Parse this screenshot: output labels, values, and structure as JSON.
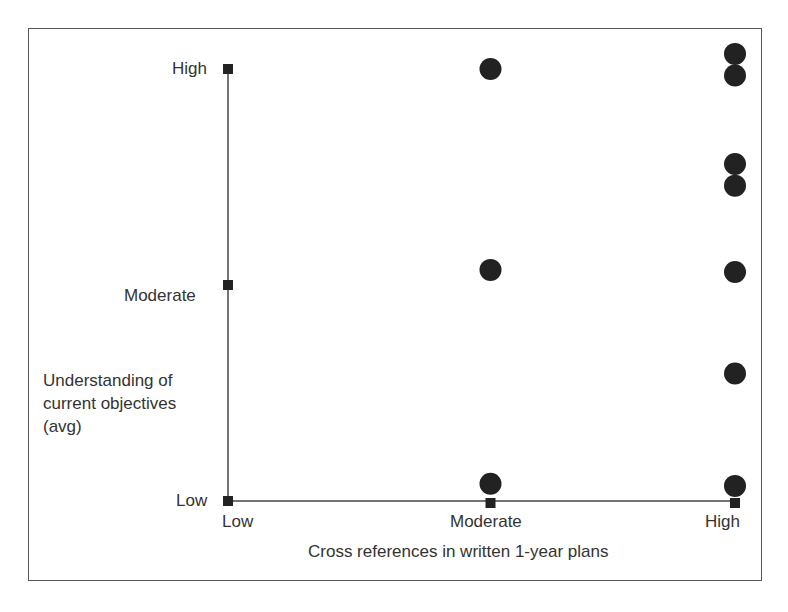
{
  "chart_data": {
    "type": "scatter",
    "title": "",
    "xlabel": "Cross references in written 1-year plans",
    "ylabel": "Understanding of current objectives (avg)",
    "ylabel_lines": [
      "Understanding of",
      "current objectives",
      "(avg)"
    ],
    "x_ticks": [
      "Low",
      "Moderate",
      "High"
    ],
    "y_ticks": [
      "Low",
      "Moderate",
      "High"
    ],
    "xlim": [
      0,
      2
    ],
    "ylim": [
      0,
      2
    ],
    "grid": false,
    "legend": null,
    "points": [
      {
        "x": 1,
        "y": 2.0
      },
      {
        "x": 1,
        "y": 1.07
      },
      {
        "x": 1,
        "y": 0.08
      },
      {
        "x": 2,
        "y": 2.07
      },
      {
        "x": 2,
        "y": 1.97
      },
      {
        "x": 2,
        "y": 1.56
      },
      {
        "x": 2,
        "y": 1.46
      },
      {
        "x": 2,
        "y": 1.06
      },
      {
        "x": 2,
        "y": 0.59
      },
      {
        "x": 2,
        "y": 0.07
      }
    ]
  },
  "colors": {
    "point": "#222222",
    "axis": "#444444",
    "text": "#333333"
  }
}
